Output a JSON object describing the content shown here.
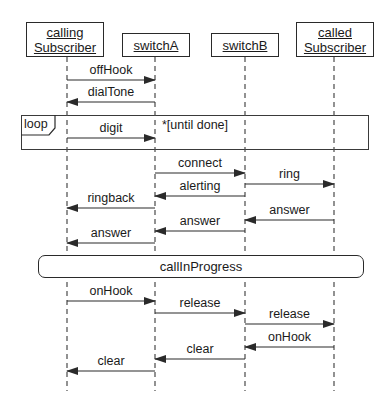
{
  "diagram": {
    "type": "uml-sequence",
    "participants": [
      {
        "id": "calling",
        "line1": "calling",
        "line2": "Subscriber",
        "x": 67,
        "box": {
          "left": 26,
          "top": 22,
          "width": 78,
          "height": 35
        }
      },
      {
        "id": "switchA",
        "line1": "switchA",
        "line2": "",
        "x": 155,
        "box": {
          "left": 122,
          "top": 33,
          "width": 68,
          "height": 24
        }
      },
      {
        "id": "switchB",
        "line1": "switchB",
        "line2": "",
        "x": 245,
        "box": {
          "left": 211,
          "top": 33,
          "width": 68,
          "height": 24
        }
      },
      {
        "id": "called",
        "line1": "called",
        "line2": "Subscriber",
        "x": 334,
        "box": {
          "left": 296,
          "top": 22,
          "width": 78,
          "height": 35
        }
      }
    ],
    "lifeline_end_y": 391,
    "messages": [
      {
        "label": "offHook",
        "from": "calling",
        "to": "switchA",
        "y": 80
      },
      {
        "label": "dialTone",
        "from": "switchA",
        "to": "calling",
        "y": 102
      },
      {
        "label": "digit",
        "from": "calling",
        "to": "switchA",
        "y": 138
      },
      {
        "label": "connect",
        "from": "switchA",
        "to": "switchB",
        "y": 173
      },
      {
        "label": "ring",
        "from": "switchB",
        "to": "called",
        "y": 184
      },
      {
        "label": "alerting",
        "from": "switchB",
        "to": "switchA",
        "y": 196
      },
      {
        "label": "ringback",
        "from": "switchA",
        "to": "calling",
        "y": 208
      },
      {
        "label": "answer",
        "from": "called",
        "to": "switchB",
        "y": 220
      },
      {
        "label": "answer",
        "from": "switchB",
        "to": "switchA",
        "y": 231
      },
      {
        "label": "answer",
        "from": "switchA",
        "to": "calling",
        "y": 243
      },
      {
        "label": "onHook",
        "from": "calling",
        "to": "switchA",
        "y": 301
      },
      {
        "label": "release",
        "from": "switchA",
        "to": "switchB",
        "y": 313
      },
      {
        "label": "release",
        "from": "switchB",
        "to": "called",
        "y": 324
      },
      {
        "label": "onHook",
        "from": "called",
        "to": "switchB",
        "y": 347
      },
      {
        "label": "clear",
        "from": "switchB",
        "to": "switchA",
        "y": 359
      },
      {
        "label": "clear",
        "from": "switchA",
        "to": "calling",
        "y": 371
      }
    ],
    "loop_fragment": {
      "operator": "loop",
      "guard": "*[until done]",
      "left": 21,
      "top": 115,
      "width": 348,
      "height": 35
    },
    "state_invariant": {
      "label": "callInProgress",
      "left": 38,
      "top": 255,
      "width": 326,
      "height": 23
    },
    "colors": {
      "line": "#2a2a2a",
      "lifeline": "#4a4a4a",
      "background": "#ffffff"
    }
  }
}
